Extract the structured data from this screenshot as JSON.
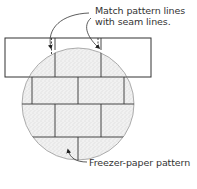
{
  "diagram": {
    "callouts": [
      {
        "id": "seam",
        "lines": [
          "Match pattern lines",
          "with seam lines."
        ]
      },
      {
        "id": "pattern",
        "lines": [
          "Freezer-paper pattern"
        ]
      }
    ],
    "elements": {
      "strip": "quilt strip rectangle",
      "circle": "stippled freezer-paper pattern circle with brick grid"
    },
    "colors": {
      "line": "#333333",
      "circle_edge": "#999999",
      "stipple": "#e8e8e8"
    }
  }
}
